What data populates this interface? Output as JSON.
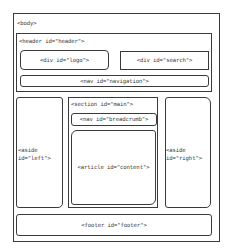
{
  "diagram": {
    "type": "html5-page-layout-wireframe",
    "body": {
      "label": "<body>"
    },
    "header": {
      "label": "<header id=\"header\">",
      "logo": {
        "label": "<div id=\"logo\">"
      },
      "search": {
        "label": "<div id=\"search\">"
      },
      "navigation": {
        "label": "<nav id=\"navigation\">"
      }
    },
    "aside_left": {
      "label_line1": "<aside",
      "label_line2": "id=\"left\">"
    },
    "section_main": {
      "label": "<section id=\"main\">",
      "breadcrumb": {
        "label": "<nav id=\"breadcrumb\">"
      },
      "article": {
        "label": "<article id=\"content\">"
      }
    },
    "aside_right": {
      "label_line1": "<aside",
      "label_line2": "id=\"right\">"
    },
    "footer": {
      "label": "<footer id=\"footer\">"
    }
  }
}
